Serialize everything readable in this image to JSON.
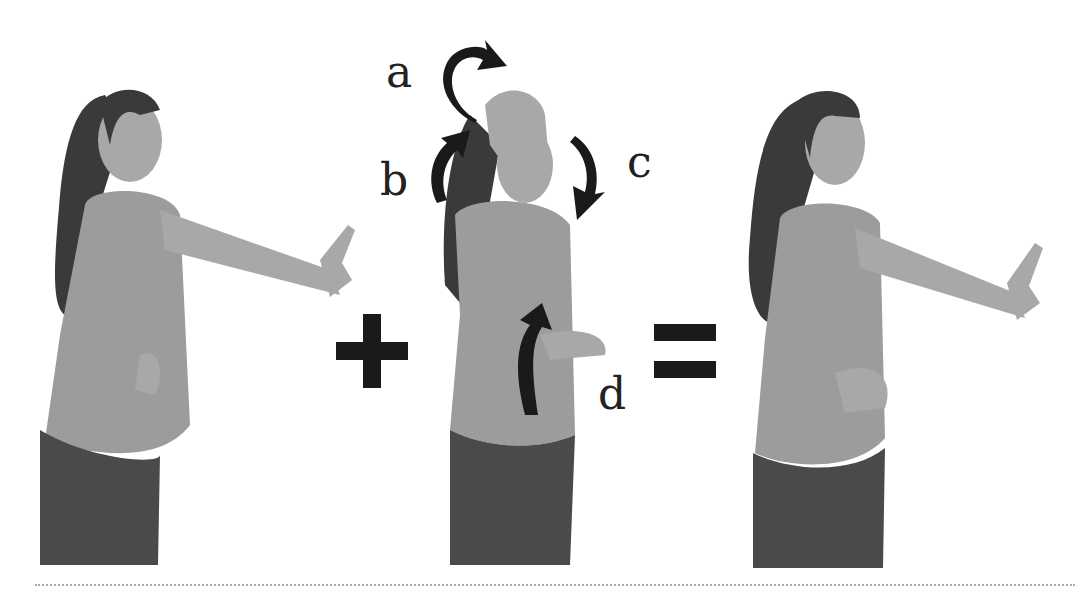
{
  "figure": {
    "panels": [
      {
        "id": "step-1",
        "pose": "standing pointing forward, puckered lips, hand on hip"
      },
      {
        "id": "step-2",
        "pose": "arm over head, torso twist with arrows"
      },
      {
        "id": "result",
        "pose": "standing pointing forward, hand on stomach"
      }
    ],
    "operators": {
      "plus": "+",
      "equals": "="
    },
    "labels": {
      "a": "a",
      "b": "b",
      "c": "c",
      "d": "d"
    },
    "colors": {
      "background": "#ffffff",
      "ink": "#1a1a1a",
      "divider": "#aaaaaa"
    }
  }
}
